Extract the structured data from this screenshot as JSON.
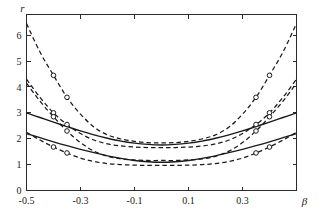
{
  "chart_data": {
    "type": "line",
    "title": "",
    "xlabel": "β",
    "ylabel": "r",
    "xlim": [
      -0.5,
      0.5
    ],
    "ylim": [
      0,
      6.8
    ],
    "grid": false,
    "legend": null,
    "x_ticks": [
      -0.5,
      -0.3,
      -0.1,
      0.1,
      0.3
    ],
    "x_tick_labels": [
      "-0.5",
      "-0.3",
      "-0.1",
      "0.1",
      "0.3"
    ],
    "y_ticks": [
      0,
      1,
      2,
      3,
      4,
      5,
      6
    ],
    "y_tick_labels": [
      "0",
      "1",
      "2",
      "3",
      "4",
      "5",
      "6"
    ],
    "x": [
      -0.5,
      -0.45,
      -0.4,
      -0.35,
      -0.3,
      -0.25,
      -0.2,
      -0.15,
      -0.1,
      -0.05,
      0.0,
      0.05,
      0.1,
      0.15,
      0.2,
      0.25,
      0.3,
      0.35,
      0.4,
      0.45,
      0.5
    ],
    "series": [
      {
        "name": "upper-solid-curve",
        "style": "solid",
        "markers": false,
        "values": [
          3.0,
          2.82,
          2.64,
          2.47,
          2.3,
          2.15,
          2.02,
          1.91,
          1.83,
          1.78,
          1.76,
          1.78,
          1.83,
          1.91,
          2.02,
          2.15,
          2.3,
          2.47,
          2.64,
          2.82,
          3.0
        ]
      },
      {
        "name": "lower-solid-curve",
        "style": "solid",
        "markers": false,
        "values": [
          2.2,
          2.04,
          1.88,
          1.73,
          1.59,
          1.46,
          1.34,
          1.24,
          1.16,
          1.11,
          1.09,
          1.11,
          1.16,
          1.24,
          1.34,
          1.46,
          1.59,
          1.73,
          1.88,
          2.04,
          2.2
        ]
      },
      {
        "name": "upper-band-upper-bound",
        "style": "dashed",
        "markers": true,
        "values": [
          6.45,
          5.35,
          4.45,
          3.6,
          2.95,
          2.45,
          2.15,
          1.99,
          1.9,
          1.85,
          1.84,
          1.85,
          1.9,
          1.99,
          2.15,
          2.45,
          2.95,
          3.6,
          4.45,
          5.35,
          6.45
        ]
      },
      {
        "name": "upper-band-lower-bound",
        "style": "dashed",
        "markers": true,
        "values": [
          4.3,
          3.6,
          3.0,
          2.55,
          2.2,
          1.95,
          1.8,
          1.72,
          1.68,
          1.66,
          1.66,
          1.66,
          1.68,
          1.72,
          1.8,
          1.95,
          2.2,
          2.55,
          3.0,
          3.6,
          4.3
        ]
      },
      {
        "name": "lower-band-upper-bound",
        "style": "dashed",
        "markers": true,
        "values": [
          4.15,
          3.45,
          2.85,
          2.3,
          1.85,
          1.52,
          1.32,
          1.22,
          1.18,
          1.16,
          1.16,
          1.16,
          1.18,
          1.22,
          1.32,
          1.52,
          1.85,
          2.3,
          2.85,
          3.45,
          4.15
        ]
      },
      {
        "name": "lower-band-lower-bound",
        "style": "dashed",
        "markers": true,
        "values": [
          2.25,
          1.95,
          1.68,
          1.45,
          1.25,
          1.12,
          1.04,
          1.0,
          0.98,
          0.97,
          0.97,
          0.97,
          0.98,
          1.0,
          1.04,
          1.12,
          1.25,
          1.45,
          1.68,
          1.95,
          2.25
        ]
      }
    ],
    "marker_x": [
      -0.4,
      -0.35,
      0.35,
      0.4
    ],
    "marker_style": "open-circle"
  }
}
